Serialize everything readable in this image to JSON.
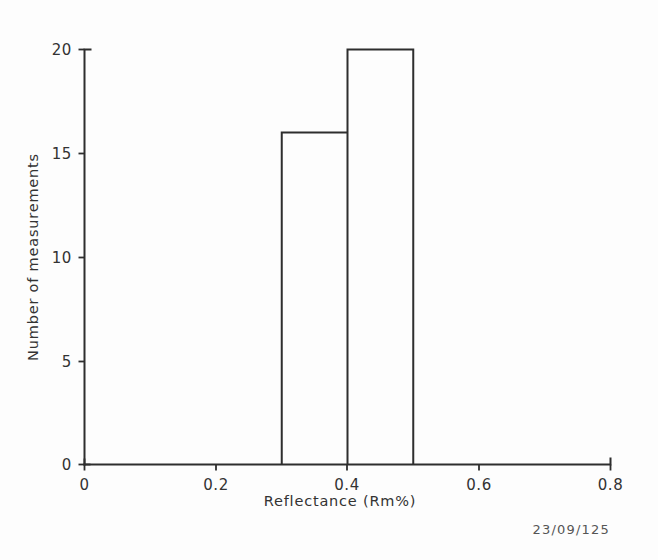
{
  "figure": {
    "stamp": "23/09/125",
    "background_color": "#fdfdfd",
    "line_color": "#2e2e2e",
    "text_color": "#333333"
  },
  "chart_data": {
    "type": "bar",
    "title": "",
    "subtitle": "",
    "xlabel": "Reflectance (Rm%)",
    "ylabel": "Number of measurements",
    "xlim": [
      0,
      0.8
    ],
    "ylim": [
      0,
      20
    ],
    "grid": false,
    "legend": false,
    "legend_position": "none",
    "xticks": [
      0,
      0.2,
      0.4,
      0.6,
      0.8
    ],
    "xtick_labels": [
      "0",
      "0.2",
      "0.4",
      "0.6",
      "0.8"
    ],
    "yticks": [
      0,
      5,
      10,
      15,
      20
    ],
    "ytick_labels": [
      "0",
      "5",
      "10",
      "15",
      "20"
    ],
    "bin_width": 0.1,
    "bins": [
      {
        "start": 0.3,
        "end": 0.4,
        "value": 16
      },
      {
        "start": 0.4,
        "end": 0.5,
        "value": 20
      }
    ],
    "categories": [
      "0.3-0.4",
      "0.4-0.5"
    ],
    "values": [
      16,
      20
    ],
    "annotations": []
  }
}
